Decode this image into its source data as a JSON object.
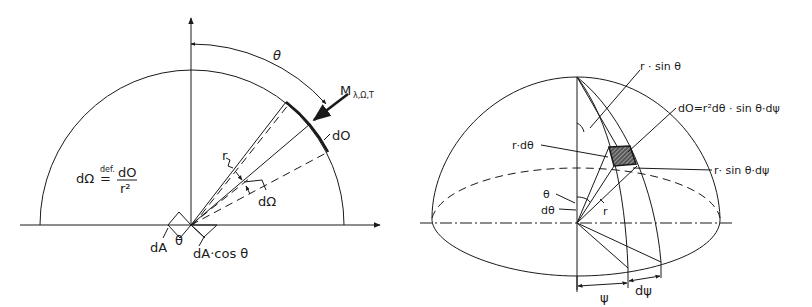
{
  "left_figure": {
    "theta_arc_label": "θ",
    "radiance_label": "M",
    "radiance_subscript": "λ,Ω,T",
    "surface_element_label": "dO",
    "radius_label": "r",
    "solid_angle_label": "dΩ",
    "definition": {
      "lhs": "dΩ",
      "operator": "=",
      "operator_superscript": "def.",
      "numerator": "dO",
      "denominator": "r²"
    },
    "area_label": "dA",
    "angle_label": "θ",
    "projected_area_label": "dA·cos θ"
  },
  "right_figure": {
    "r_sin_theta_label": "r · sin θ",
    "surface_element_formula": "dO=r²dθ · sin θ·dψ",
    "r_dtheta_label": "r·dθ",
    "r_sin_theta_dpsi_label": "r· sin θ·dψ",
    "theta_label": "θ",
    "dtheta_label": "dθ",
    "radius_label": "r",
    "psi_label": "ψ",
    "dpsi_label": "dψ"
  },
  "colors": {
    "ink": "#1a1a1a",
    "background": "#ffffff"
  }
}
